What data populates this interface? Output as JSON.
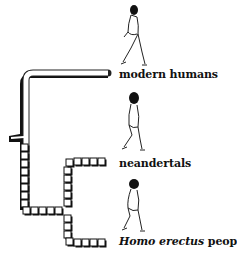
{
  "diagram": {
    "type": "phylogenetic-tree",
    "taxa": [
      {
        "id": "modern-humans",
        "label": "modern humans",
        "italic_part": "",
        "rest": "modern humans"
      },
      {
        "id": "neandertals",
        "label": "neandertals",
        "italic_part": "",
        "rest": "neandertals"
      },
      {
        "id": "homo-erectus",
        "label": "Homo erectus people",
        "italic_part": "Homo erectus",
        "rest": " people"
      }
    ],
    "icons": [
      "walking-modern-human-icon",
      "walking-neandertal-icon",
      "walking-homo-erectus-icon"
    ],
    "colors": {
      "line": "#111111",
      "background": "#ffffff"
    }
  }
}
